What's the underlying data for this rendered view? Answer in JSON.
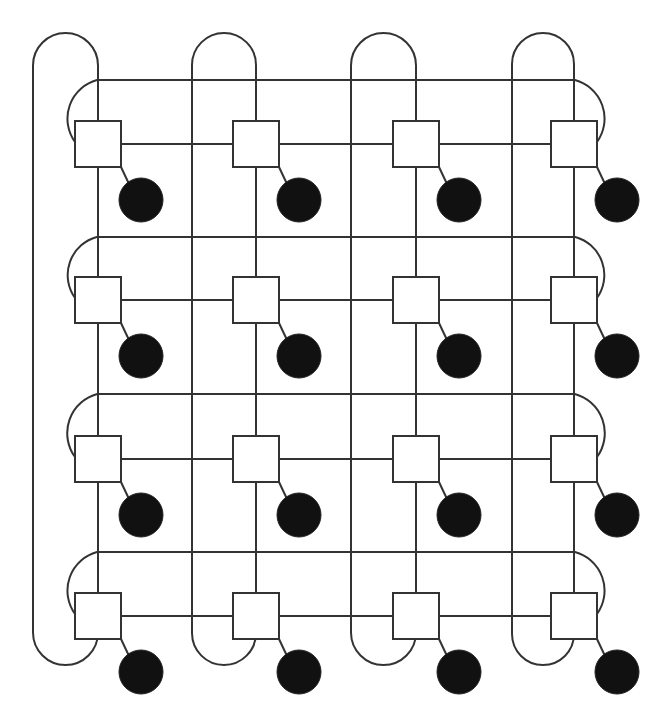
{
  "diagram": {
    "type": "4x4 2D torus network",
    "rows": 4,
    "cols": 4,
    "colors": {
      "line": "#333333",
      "switch_fill": "#ffffff",
      "node_fill": "#111111",
      "background": "#ffffff"
    },
    "geometry": {
      "col_x": [
        98,
        256,
        416,
        574
      ],
      "row_y": [
        144,
        300,
        459,
        616
      ],
      "switch_half": 23,
      "node_offset": [
        43,
        56
      ],
      "node_radius": 22,
      "col_wrap_x": [
        33,
        192,
        351,
        512
      ],
      "row_wrap_y": [
        80,
        237,
        394,
        552
      ],
      "top_arc_y": 33,
      "bottom_arc_y": 665,
      "right_arc_x": 625,
      "left_arc_x": 56
    },
    "switches": [
      {
        "id": "s00"
      },
      {
        "id": "s01"
      },
      {
        "id": "s02"
      },
      {
        "id": "s03"
      },
      {
        "id": "s10"
      },
      {
        "id": "s11"
      },
      {
        "id": "s12"
      },
      {
        "id": "s13"
      },
      {
        "id": "s20"
      },
      {
        "id": "s21"
      },
      {
        "id": "s22"
      },
      {
        "id": "s23"
      },
      {
        "id": "s30"
      },
      {
        "id": "s31"
      },
      {
        "id": "s32"
      },
      {
        "id": "s33"
      }
    ],
    "nodes_per_switch": 1
  }
}
